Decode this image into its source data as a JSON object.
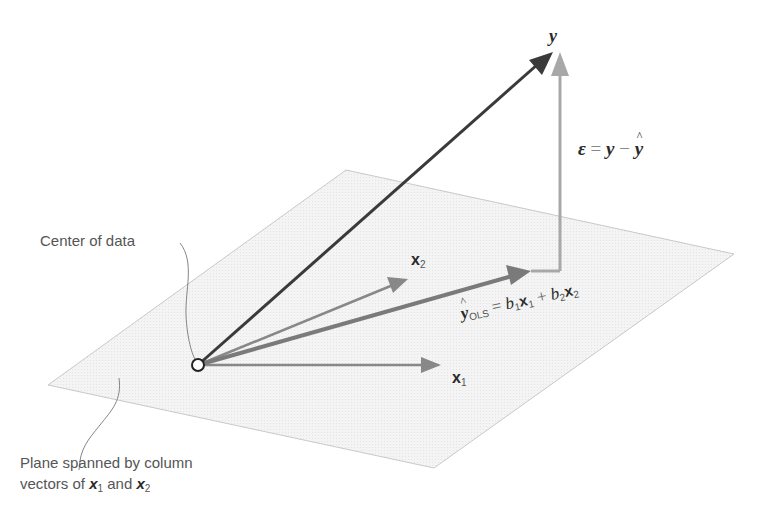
{
  "figure": {
    "colors": {
      "plane_fill": "#f2f2f2",
      "plane_edge": "#c8c8c8",
      "y_vector": "#3a3a3a",
      "yhat_vector": "#7a7a7a",
      "residual_vector": "#a8a8a8",
      "x_vectors": "#888888",
      "origin_fill": "#ffffff",
      "origin_stroke": "#222222"
    },
    "geometry": {
      "origin": [
        198,
        365
      ],
      "plane_corners": [
        [
          346,
          170
        ],
        [
          734,
          254
        ],
        [
          434,
          468
        ],
        [
          48,
          385
        ]
      ],
      "y_tip": [
        553,
        52
      ],
      "yhat_tip": [
        531,
        271
      ],
      "x1_tip": [
        441,
        365
      ],
      "x2_tip": [
        408,
        279
      ]
    }
  },
  "labels": {
    "y": "y",
    "residual": {
      "epsilon": "ε",
      "eq": "=",
      "y": "y",
      "minus": "−",
      "yhat": "y"
    },
    "x2": {
      "base": "x",
      "sub": "2"
    },
    "x1": {
      "base": "x",
      "sub": "1"
    },
    "yhat_ols": {
      "yhat": "y",
      "sub": "OLS",
      "eq": "=",
      "b1": "b",
      "b1_sub": "1",
      "x1": "x",
      "x1_sub": "1",
      "plus": "+",
      "b2": "b",
      "b2_sub": "2",
      "x2": "x",
      "x2_sub": "2"
    },
    "center_of_data": "Center of data",
    "plane_caption": {
      "line1": "Plane spanned by column",
      "line2_prefix": "vectors of",
      "x1": "x",
      "x1_sub": "1",
      "and": "and",
      "x2": "x",
      "x2_sub": "2"
    }
  }
}
